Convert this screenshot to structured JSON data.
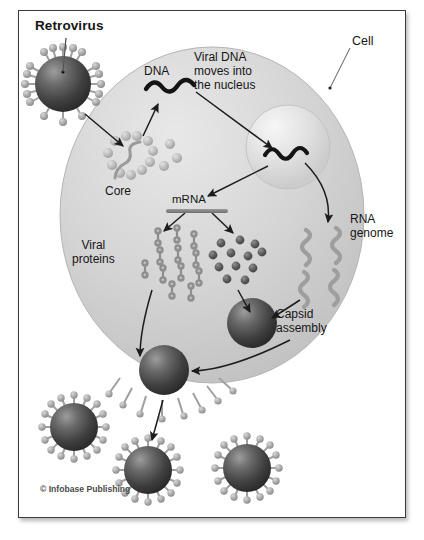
{
  "figure": {
    "kind": "biology-diagram",
    "background": "#ffffff",
    "plate_border": "#3a3a3a"
  },
  "labels": {
    "retrovirus": "Retrovirus",
    "cell": "Cell",
    "dna": "DNA",
    "viral_dna_nucleus": "Viral DNA\nmoves into\nthe nucleus",
    "core": "Core",
    "mrna": "mRNA",
    "viral_proteins": "Viral\nproteins",
    "rna_genome": "RNA\ngenome",
    "capsid_assembly": "Capsid\nassembly",
    "copyright": "© Infobase Publishing"
  },
  "colors": {
    "cell_fill": "#d0d0d0",
    "nucleus_fill": "#dcdcdc",
    "capsid_dark": "#3c3c3c",
    "spike_grey": "#a8a8a8",
    "rna_grey": "#9e9e9e",
    "dna_black": "#141414",
    "arrow": "#1c1c1c",
    "text": "#161616"
  },
  "elements": {
    "free_virions": 4,
    "budding_virions": 2,
    "rna_genome_strands": 4,
    "protein_glyphs": 12,
    "nucleotide_beads": 12,
    "core_beads": 14
  }
}
